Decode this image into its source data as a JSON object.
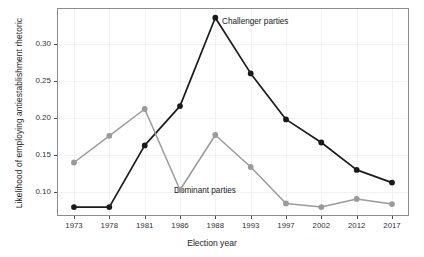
{
  "chart_data": {
    "type": "line",
    "title": "",
    "xlabel": "Election year",
    "ylabel": "Likelihood of employing antiestablishment rhetoric",
    "categories": [
      "1973",
      "1978",
      "1981",
      "1986",
      "1988",
      "1993",
      "1997",
      "2002",
      "2012",
      "2017"
    ],
    "xtick_labels": [
      "1973",
      "1978",
      "1981",
      "1986",
      "1988",
      "1993",
      "1997",
      "2002",
      "2012",
      "2017"
    ],
    "ytick_labels": [
      "0.10",
      "0.15",
      "0.20",
      "0.25",
      "0.30"
    ],
    "ytick_values": [
      0.1,
      0.15,
      0.2,
      0.25,
      0.3
    ],
    "ylim": [
      0.068,
      0.348
    ],
    "grid": true,
    "legend_position": "inline-annotations",
    "series": [
      {
        "name": "Challenger parties",
        "color": "#1a1a1a",
        "marker": "circle",
        "values": [
          0.08,
          0.08,
          0.163,
          0.216,
          0.335,
          0.26,
          0.198,
          0.167,
          0.13,
          0.113
        ]
      },
      {
        "name": "Dominant parties",
        "color": "#9a9a9a",
        "marker": "circle",
        "values": [
          0.14,
          0.176,
          0.212,
          0.103,
          0.177,
          0.134,
          0.085,
          0.08,
          0.091,
          0.084
        ]
      }
    ],
    "annotations": [
      {
        "text": "Challenger parties",
        "series": "Challenger parties",
        "x_px": 222,
        "y_px": 17
      },
      {
        "text": "Dominant parties",
        "series": "Dominant parties",
        "x_px": 174,
        "y_px": 186
      }
    ]
  }
}
